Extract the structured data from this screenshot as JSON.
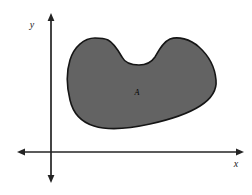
{
  "figure": {
    "caption_text": "",
    "background_color": "#ffffff",
    "width": 252,
    "height": 195
  },
  "axes": {
    "color": "#242424",
    "origin": {
      "x": 51,
      "y": 152
    },
    "x_axis": {
      "label": "x",
      "label_x": 236,
      "label_y": 167,
      "start_x": 18,
      "end_x": 243,
      "y": 152,
      "arrow_left": true,
      "arrow_right": true
    },
    "y_axis": {
      "label": "y",
      "label_x": 32,
      "label_y": 28,
      "x": 51,
      "start_y": 14,
      "end_y": 182,
      "arrow_up": true,
      "arrow_down": true
    }
  },
  "region": {
    "label": "A",
    "label_x": 137,
    "label_y": 95,
    "fill_color": "#636363",
    "stroke_color": "#151515",
    "stroke_width": 1.6,
    "description": "kidney-shaped shaded region A in the first quadrant",
    "path": "M 95 38 C 84 38 74 47 70 60 C 66 73 67 88 70 100 C 73 113 81 122 94 126 C 110 131 132 128 150 124 C 168 120 186 115 200 106 C 211 99 217 90 216 80 C 215 68 209 56 199 47 C 190 39 178 36 170 39 C 163 42 159 50 155 57 C 151 63 146 65 139 65 C 131 65 125 63 122 57 C 118 50 114 43 108 40 C 104 38 99 38 95 38 Z"
  },
  "colors": {
    "ink": "#1a1a1a",
    "shade": "#636363",
    "outline": "#151515",
    "paper": "#ffffff"
  }
}
